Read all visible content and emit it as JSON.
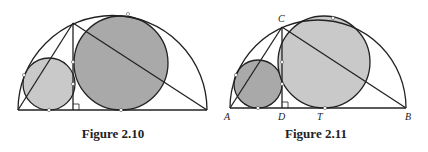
{
  "figures": [
    {
      "caption": "Figure 2.10",
      "colors": {
        "small_circle": "#c9c9c9",
        "big_circle": "#a9a9a9"
      },
      "labels": []
    },
    {
      "caption": "Figure 2.11",
      "colors": {
        "small_circle": "#a9a9a9",
        "big_circle": "#c9c9c9"
      },
      "labels": {
        "A": "A",
        "B": "B",
        "C": "C",
        "D": "D",
        "T": "T"
      }
    }
  ]
}
